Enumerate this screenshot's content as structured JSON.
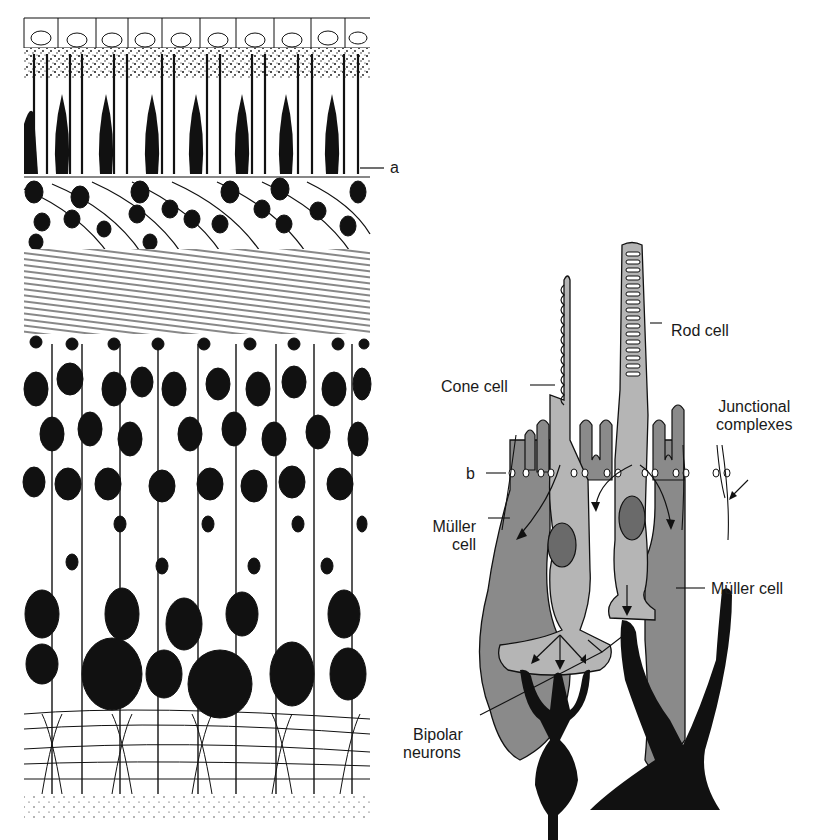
{
  "figure": {
    "left_panel": {
      "description": "Histological drawing of retinal layers",
      "labels": {
        "a": "a"
      }
    },
    "right_panel": {
      "description": "Schematic of photoreceptors, Müller cells and bipolar neurons",
      "labels": {
        "rod_cell": "Rod cell",
        "cone_cell": "Cone cell",
        "junctional_complexes": [
          "Junctional",
          "complexes"
        ],
        "b": "b",
        "muller_cell_left": [
          "Müller",
          "cell"
        ],
        "muller_cell_right": "Müller cell",
        "bipolar_neurons": [
          "Bipolar",
          "neurons"
        ]
      }
    },
    "colors": {
      "ink": "#111111",
      "muller_gray": "#8a8a8a",
      "photoreceptor_gray": "#b5b5b5",
      "nucleus_gray": "#6a6a6a",
      "background": "#ffffff"
    }
  }
}
